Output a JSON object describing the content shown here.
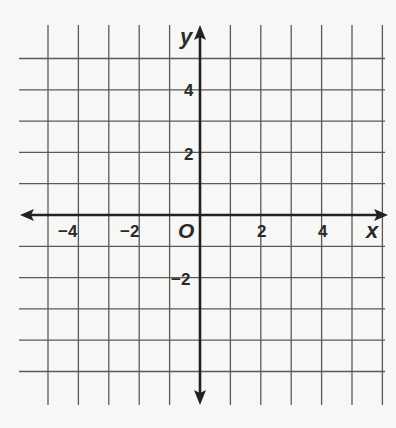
{
  "chart_data": {
    "type": "scatter",
    "title": "",
    "xlabel": "x",
    "ylabel": "y",
    "origin_label": "O",
    "xlim": [
      -5,
      6
    ],
    "ylim": [
      -6,
      6
    ],
    "grid": true,
    "grid_step": 1,
    "x_ticks": [
      -4,
      -2,
      2,
      4
    ],
    "y_ticks": [
      4,
      2,
      -2
    ],
    "x_tick_labels": [
      "−4",
      "−2",
      "2",
      "4"
    ],
    "y_tick_labels": [
      "4",
      "2",
      "−2"
    ],
    "series": [],
    "legend": null
  },
  "labels": {
    "x_axis": "x",
    "y_axis": "y",
    "origin": "O",
    "x_ticks": [
      "−4",
      "−2",
      "2",
      "4"
    ],
    "y_ticks": [
      "4",
      "2",
      "−2"
    ]
  },
  "colors": {
    "background": "#f7f7f5",
    "grid": "#555555",
    "axis": "#222222",
    "text": "#2a2a2a"
  }
}
